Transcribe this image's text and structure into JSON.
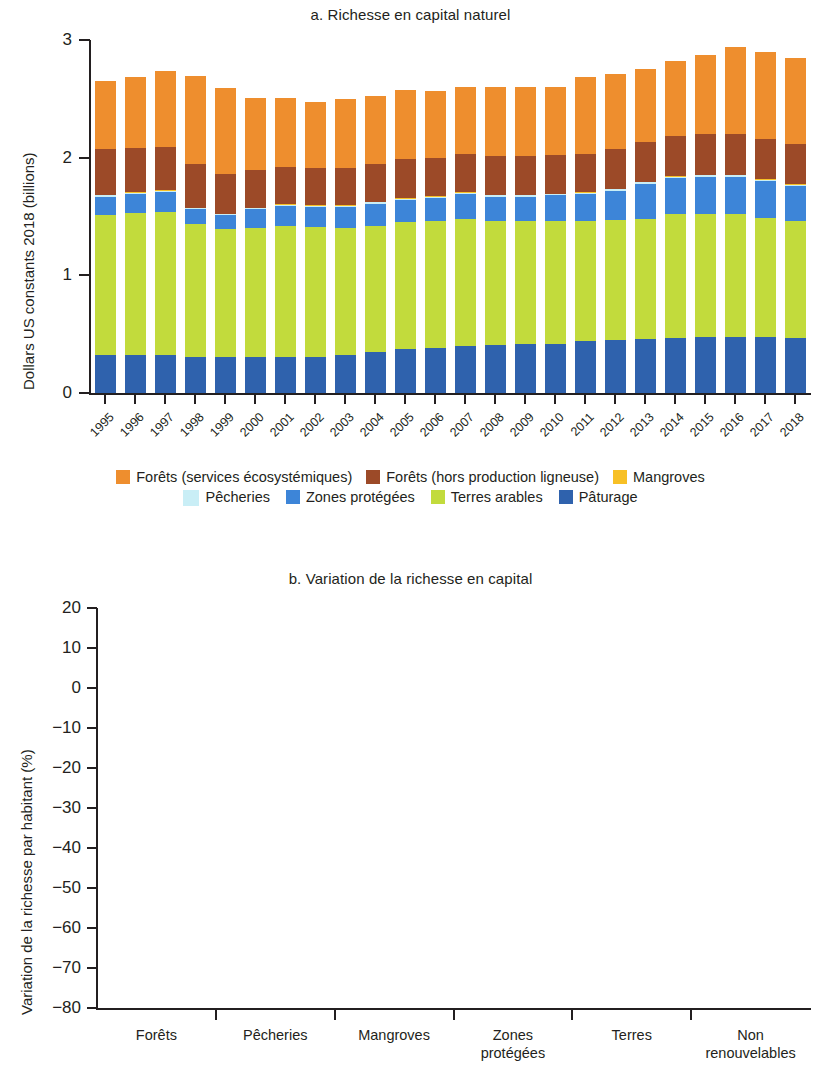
{
  "figure": {
    "panel_a": {
      "title": "a. Richesse en capital naturel",
      "ylabel": "Dollars US constants 2018 (billions)"
    },
    "panel_b": {
      "title": "b. Variation de la richesse en capital",
      "ylabel": "Variation de la richesse par habitant (%)"
    }
  },
  "chart_data": [
    {
      "type": "bar",
      "stacked": true,
      "title": "a. Richesse en capital naturel",
      "xlabel": "",
      "ylabel": "Dollars US constants 2018 (billions)",
      "ylim": [
        0,
        3
      ],
      "yticks": [
        0,
        1,
        2,
        3
      ],
      "ytick_labels": [
        "0",
        "1",
        "2",
        "3"
      ],
      "grid": false,
      "legend_position": "bottom",
      "categories": [
        "1995",
        "1996",
        "1997",
        "1998",
        "1999",
        "2000",
        "2001",
        "2002",
        "2003",
        "2004",
        "2005",
        "2006",
        "2007",
        "2008",
        "2009",
        "2010",
        "2011",
        "2012",
        "2013",
        "2014",
        "2015",
        "2016",
        "2017",
        "2018"
      ],
      "series": [
        {
          "name": "Pâturage",
          "color": "#2f62ad",
          "values": [
            0.32,
            0.32,
            0.32,
            0.31,
            0.31,
            0.31,
            0.31,
            0.31,
            0.32,
            0.35,
            0.37,
            0.38,
            0.4,
            0.41,
            0.42,
            0.42,
            0.44,
            0.45,
            0.46,
            0.47,
            0.48,
            0.48,
            0.48,
            0.47
          ]
        },
        {
          "name": "Terres arables",
          "color": "#c2db3c",
          "values": [
            1.19,
            1.21,
            1.22,
            1.13,
            1.08,
            1.09,
            1.11,
            1.1,
            1.08,
            1.07,
            1.08,
            1.08,
            1.08,
            1.05,
            1.04,
            1.04,
            1.02,
            1.02,
            1.02,
            1.05,
            1.04,
            1.04,
            1.01,
            0.99
          ]
        },
        {
          "name": "Zones protégées",
          "color": "#3d85d8",
          "values": [
            0.16,
            0.16,
            0.17,
            0.12,
            0.12,
            0.16,
            0.17,
            0.17,
            0.18,
            0.19,
            0.19,
            0.2,
            0.21,
            0.21,
            0.21,
            0.22,
            0.23,
            0.25,
            0.3,
            0.31,
            0.32,
            0.32,
            0.31,
            0.3
          ]
        },
        {
          "name": "Pêcheries",
          "color": "#c9eef6",
          "values": [
            0.01,
            0.01,
            0.01,
            0.01,
            0.01,
            0.01,
            0.01,
            0.01,
            0.01,
            0.01,
            0.01,
            0.01,
            0.01,
            0.01,
            0.01,
            0.01,
            0.01,
            0.01,
            0.01,
            0.01,
            0.01,
            0.01,
            0.01,
            0.01
          ]
        },
        {
          "name": "Mangroves",
          "color": "#f7c026",
          "values": [
            0.005,
            0.005,
            0.005,
            0.005,
            0.005,
            0.005,
            0.005,
            0.005,
            0.005,
            0.005,
            0.005,
            0.005,
            0.005,
            0.005,
            0.005,
            0.005,
            0.005,
            0.005,
            0.005,
            0.005,
            0.005,
            0.005,
            0.005,
            0.005
          ]
        },
        {
          "name": "Forêts (hors production ligneuse)",
          "color": "#9c4a28",
          "values": [
            0.39,
            0.38,
            0.37,
            0.37,
            0.34,
            0.32,
            0.32,
            0.32,
            0.32,
            0.32,
            0.33,
            0.32,
            0.33,
            0.33,
            0.33,
            0.33,
            0.33,
            0.34,
            0.34,
            0.34,
            0.35,
            0.35,
            0.34,
            0.34
          ]
        },
        {
          "name": "Forêts (services écosystémiques)",
          "color": "#ee8e2e",
          "values": [
            0.58,
            0.6,
            0.64,
            0.75,
            0.73,
            0.61,
            0.58,
            0.56,
            0.58,
            0.58,
            0.59,
            0.57,
            0.57,
            0.59,
            0.59,
            0.58,
            0.65,
            0.64,
            0.62,
            0.64,
            0.67,
            0.74,
            0.74,
            0.73
          ]
        }
      ],
      "legend": [
        {
          "label": "Forêts (services écosystémiques)",
          "color": "#ee8e2e"
        },
        {
          "label": "Forêts (hors production ligneuse)",
          "color": "#9c4a28"
        },
        {
          "label": "Mangroves",
          "color": "#f7c026"
        },
        {
          "label": "Pêcheries",
          "color": "#c9eef6"
        },
        {
          "label": "Zones protégées",
          "color": "#3d85d8"
        },
        {
          "label": "Terres arables",
          "color": "#c2db3c"
        },
        {
          "label": "Pâturage",
          "color": "#2f62ad"
        }
      ]
    },
    {
      "type": "bar",
      "stacked": false,
      "title": "b. Variation de la richesse en capital",
      "xlabel": "",
      "ylabel": "Variation de la richesse par habitant (%)",
      "ylim": [
        -80,
        20
      ],
      "yticks": [
        20,
        10,
        0,
        -10,
        -20,
        -30,
        -40,
        -50,
        -60,
        -70,
        -80
      ],
      "ytick_labels": [
        "20",
        "10",
        "0",
        "−10",
        "−20",
        "−30",
        "−40",
        "−50",
        "−60",
        "−70",
        "−80"
      ],
      "grid": false,
      "zero_reference_line": true,
      "bar_color": "#eb9440",
      "categories": [
        "Forêts",
        "Pêcheries",
        "Mangroves",
        "Zones protégées",
        "Terres",
        "Non renouvelables"
      ],
      "category_lines": [
        [
          "Forêts"
        ],
        [
          "Pêcheries"
        ],
        [
          "Mangroves"
        ],
        [
          "Zones",
          "protégées"
        ],
        [
          "Terres"
        ],
        [
          "Non",
          "renouvelables"
        ]
      ],
      "values": [
        -36.4,
        -75.1,
        11.5,
        -6.5,
        -49.5,
        -7.1
      ],
      "data_labels": [
        "−36,4",
        "−75,1",
        "11,5",
        "−6,5",
        "−49,5",
        "−7,1"
      ]
    }
  ]
}
